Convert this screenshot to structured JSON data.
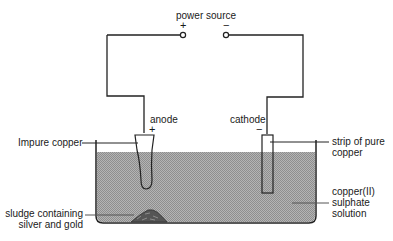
{
  "diagram": {
    "power_source": {
      "label": "power source",
      "positive_sign": "+",
      "negative_sign": "−"
    },
    "anode": {
      "label": "anode",
      "sign": "+"
    },
    "cathode": {
      "label": "cathode",
      "sign": "−"
    },
    "callouts": {
      "impure_copper": "Impure copper",
      "pure_copper_line1": "strip of pure",
      "pure_copper_line2": "copper",
      "solution_line1": "copper(II)",
      "solution_line2": "sulphate",
      "solution_line3": "solution",
      "sludge_line1": "sludge containing",
      "sludge_line2": "silver and gold"
    },
    "colors": {
      "line": "#222222",
      "solution_fill": "#a9a9a9",
      "sludge_fill": "#5a5a5a",
      "background": "#ffffff"
    }
  }
}
